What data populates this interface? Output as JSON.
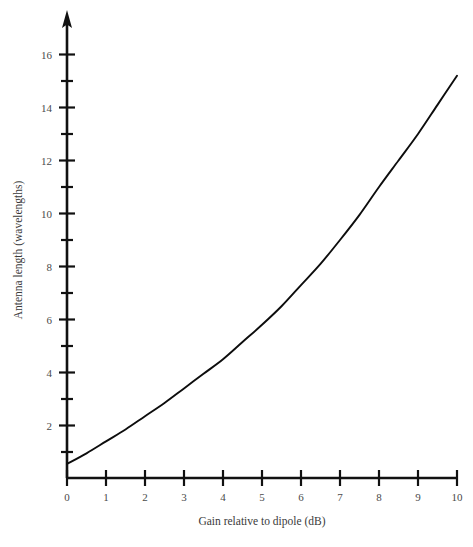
{
  "chart_data": {
    "type": "line",
    "title": "",
    "xlabel": "Gain relative to dipole (dB)",
    "ylabel": "Antenna length (wavelengths)",
    "xlim": [
      0,
      10
    ],
    "ylim": [
      0,
      16.8
    ],
    "grid": false,
    "legend": null,
    "x_ticks": [
      0,
      1,
      2,
      3,
      4,
      5,
      6,
      7,
      8,
      9,
      10
    ],
    "x_tick_labels": [
      "0",
      "1",
      "2",
      "3",
      "4",
      "5",
      "6",
      "7",
      "8",
      "9",
      "10"
    ],
    "y_ticks_major": [
      2,
      4,
      6,
      8,
      10,
      12,
      14,
      16
    ],
    "y_tick_labels": [
      "2",
      "4",
      "6",
      "8",
      "10",
      "12",
      "14",
      "16"
    ],
    "y_ticks_minor": [
      1,
      3,
      5,
      7,
      9,
      11,
      13,
      15
    ],
    "y_axis_arrow": true,
    "series": [
      {
        "name": "antenna length vs gain",
        "color": "#0d0d0d",
        "x": [
          0,
          0.5,
          1,
          1.5,
          2,
          2.5,
          3,
          3.5,
          4,
          4.5,
          5,
          5.5,
          6,
          6.5,
          7,
          7.5,
          8,
          8.5,
          9,
          9.5,
          10
        ],
        "y": [
          0.55,
          0.95,
          1.4,
          1.85,
          2.35,
          2.85,
          3.4,
          3.95,
          4.5,
          5.15,
          5.8,
          6.5,
          7.3,
          8.1,
          9.0,
          9.95,
          11.0,
          12.0,
          13.0,
          14.1,
          15.2
        ]
      }
    ]
  },
  "labels": {
    "x_title": "Gain relative to dipole (dB)",
    "y_title": "Antenna length (wavelengths)",
    "x0": "0",
    "x1": "1",
    "x2": "2",
    "x3": "3",
    "x4": "4",
    "x5": "5",
    "x6": "6",
    "x7": "7",
    "x8": "8",
    "x9": "9",
    "x10": "10",
    "y2": "2",
    "y4": "4",
    "y6": "6",
    "y8": "8",
    "y10": "10",
    "y12": "12",
    "y14": "14",
    "y16": "16"
  }
}
